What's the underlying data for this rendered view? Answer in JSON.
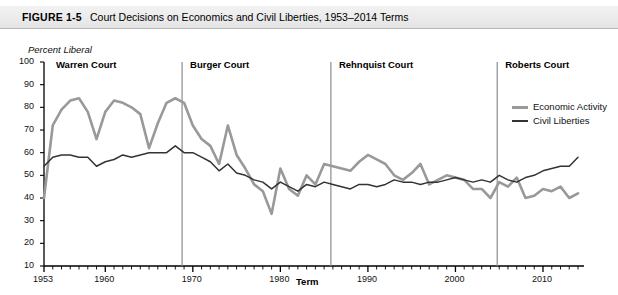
{
  "figure": {
    "label": "FIGURE 1-5",
    "title": "Court Decisions on Economics and Civil Liberties, 1953–2014 Terms"
  },
  "chart_data": {
    "type": "line",
    "title": "Court Decisions on Economics and Civil Liberties, 1953–2014 Terms",
    "xlabel": "Term",
    "ylabel": "Percent Liberal",
    "xlim": [
      1953,
      2014
    ],
    "ylim": [
      10,
      100
    ],
    "ytick_labels": [
      "100",
      "90",
      "80",
      "70",
      "60",
      "50",
      "40",
      "30",
      "20",
      "10"
    ],
    "ytick_values": [
      100,
      90,
      80,
      70,
      60,
      50,
      40,
      30,
      20,
      10
    ],
    "xtick_labels": [
      "1953",
      "1960",
      "1970",
      "1980",
      "1990",
      "2000",
      "2010"
    ],
    "xtick_values": [
      1953,
      1960,
      1970,
      1980,
      1990,
      2000,
      2010
    ],
    "grid": false,
    "legend_position": "upper-right",
    "x": [
      1953,
      1954,
      1955,
      1956,
      1957,
      1958,
      1959,
      1960,
      1961,
      1962,
      1963,
      1964,
      1965,
      1966,
      1967,
      1968,
      1969,
      1970,
      1971,
      1972,
      1973,
      1974,
      1975,
      1976,
      1977,
      1978,
      1979,
      1980,
      1981,
      1982,
      1983,
      1984,
      1985,
      1986,
      1987,
      1988,
      1989,
      1990,
      1991,
      1992,
      1993,
      1994,
      1995,
      1996,
      1997,
      1998,
      1999,
      2000,
      2001,
      2002,
      2003,
      2004,
      2005,
      2006,
      2007,
      2008,
      2009,
      2010,
      2011,
      2012,
      2013,
      2014
    ],
    "series": [
      {
        "name": "Economic Activity",
        "color": "#999999",
        "width": 2.6,
        "values": [
          40,
          72,
          79,
          83,
          84,
          78,
          66,
          78,
          83,
          82,
          80,
          77,
          62,
          73,
          82,
          84,
          82,
          72,
          66,
          63,
          55,
          72,
          59,
          53,
          46,
          43,
          33,
          53,
          44,
          41,
          50,
          46,
          55,
          54,
          53,
          52,
          56,
          59,
          57,
          55,
          50,
          48,
          51,
          55,
          46,
          48,
          50,
          49,
          48,
          44,
          44,
          40,
          47,
          45,
          49,
          40,
          41,
          44,
          43,
          45,
          40,
          42
        ]
      },
      {
        "name": "Civil Liberties",
        "color": "#333333",
        "width": 1.5,
        "values": [
          54,
          58,
          59,
          59,
          58,
          58,
          54,
          56,
          57,
          59,
          58,
          59,
          60,
          60,
          60,
          63,
          60,
          60,
          58,
          56,
          52,
          55,
          51,
          50,
          48,
          47,
          44,
          47,
          45,
          43,
          46,
          45,
          47,
          46,
          45,
          44,
          46,
          46,
          45,
          46,
          48,
          47,
          47,
          46,
          47,
          47,
          48,
          49,
          48,
          47,
          48,
          47,
          50,
          48,
          47,
          49,
          50,
          52,
          53,
          54,
          54,
          58
        ]
      }
    ],
    "eras": [
      {
        "name": "Warren Court",
        "start": 1953,
        "end": 1968
      },
      {
        "name": "Burger Court",
        "start": 1969,
        "end": 1985
      },
      {
        "name": "Rehnquist Court",
        "start": 1986,
        "end": 2004
      },
      {
        "name": "Roberts Court",
        "start": 2005,
        "end": 2014
      }
    ]
  },
  "legend": {
    "items": [
      {
        "label": "Economic Activity",
        "color": "#999999"
      },
      {
        "label": "Civil Liberties",
        "color": "#333333"
      }
    ]
  },
  "colors": {
    "economic_activity": "#999999",
    "civil_liberties": "#333333",
    "axis": "#000000",
    "era_divider": "#8c8c8c",
    "title_band": "#ebebeb"
  }
}
